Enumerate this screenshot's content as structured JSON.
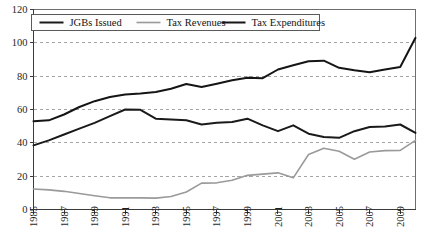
{
  "chart_data": {
    "type": "line",
    "title": "",
    "xlabel": "",
    "ylabel": "",
    "xlim": [
      1985,
      2010
    ],
    "ylim": [
      0,
      120
    ],
    "ytick_values": [
      0,
      20,
      40,
      60,
      80,
      100,
      120
    ],
    "ytick_labels": [
      "0",
      "20",
      "40",
      "60",
      "80",
      "100",
      "120"
    ],
    "xtick_values": [
      1985,
      1987,
      1989,
      1991,
      1993,
      1995,
      1997,
      1999,
      2001,
      2003,
      2005,
      2007,
      2009
    ],
    "xtick_labels": [
      "1985",
      "1987",
      "1989",
      "1991",
      "1993",
      "1995",
      "1997",
      "1999",
      "2001",
      "2003",
      "2005",
      "2007",
      "2009"
    ],
    "grid": true,
    "grid_axis": "y",
    "legend_position": "top",
    "x": [
      1985,
      1986,
      1987,
      1988,
      1989,
      1990,
      1991,
      1992,
      1993,
      1994,
      1995,
      1996,
      1997,
      1998,
      1999,
      2000,
      2001,
      2002,
      2003,
      2004,
      2005,
      2006,
      2007,
      2008,
      2009,
      2010
    ],
    "series": [
      {
        "name": "JGBs Issued",
        "color": "#1a1a1a",
        "width": 2.0,
        "values": [
          38.5,
          41.5,
          45.0,
          48.5,
          52.0,
          56.0,
          60.0,
          59.8,
          54.5,
          54.0,
          53.5,
          51.0,
          52.0,
          52.5,
          54.5,
          50.5,
          47.0,
          50.5,
          45.5,
          43.5,
          43.0,
          47.0,
          49.5,
          49.8,
          51.0,
          46.0
        ]
      },
      {
        "name": "Tax Revenues",
        "color": "#9a9a9a",
        "width": 1.6,
        "values": [
          12.3,
          11.8,
          10.9,
          9.6,
          8.3,
          7.0,
          7.0,
          7.0,
          6.8,
          7.8,
          10.5,
          15.8,
          16.0,
          17.5,
          20.5,
          21.2,
          22.0,
          19.0,
          33.0,
          36.8,
          35.0,
          30.2,
          34.5,
          35.3,
          35.5,
          41.5
        ]
      },
      {
        "name": "Tax Expenditures",
        "color": "#151515",
        "width": 2.0,
        "values": [
          53.0,
          53.5,
          57.0,
          61.5,
          65.0,
          67.5,
          69.0,
          69.6,
          70.5,
          72.5,
          75.3,
          73.5,
          75.5,
          77.5,
          79.0,
          78.8,
          84.0,
          86.5,
          89.0,
          89.3,
          85.0,
          83.5,
          82.3,
          84.0,
          85.5,
          103.0
        ]
      }
    ],
    "legend_entries": [
      "JGBs Issued",
      "Tax Revenues",
      "Tax Expenditures"
    ]
  },
  "caption": {
    "text": ""
  }
}
